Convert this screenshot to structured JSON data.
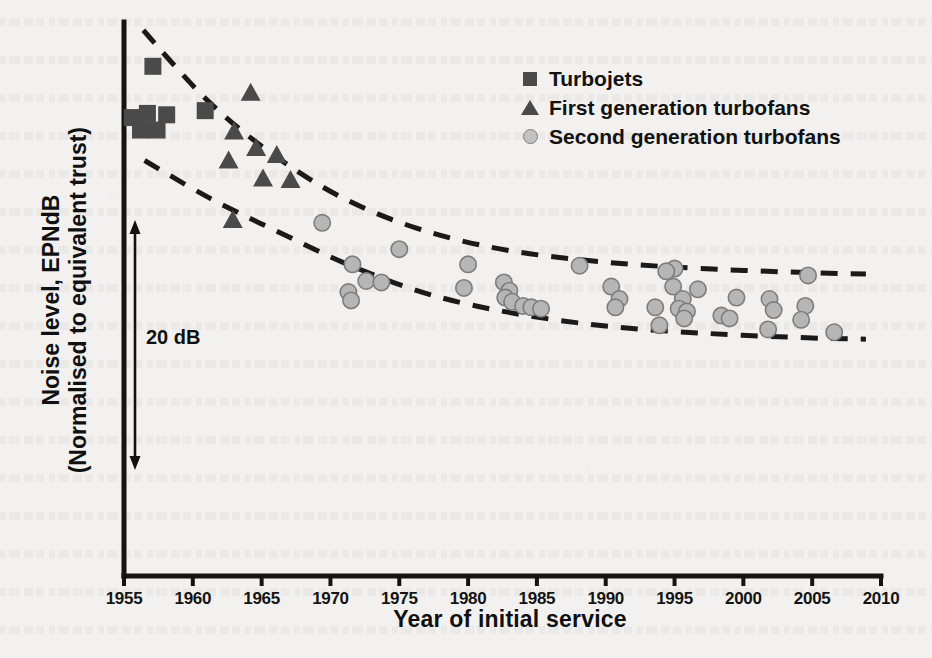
{
  "chart_data": {
    "type": "scatter",
    "title": "",
    "xlabel": "Year of initial service",
    "ylabel": "Noise level, EPNdB\n(Normalised to equivalent trust)",
    "ylabel_line1": "Noise level, EPNdB",
    "ylabel_line2": "(Normalised to equivalent trust)",
    "xlim": [
      1955,
      2010
    ],
    "ylim": [
      0,
      40
    ],
    "xticks": [
      1955,
      1960,
      1965,
      1970,
      1975,
      1980,
      1985,
      1990,
      1995,
      2000,
      2005,
      2010
    ],
    "yticks": [],
    "grid": false,
    "annotations": [
      {
        "name": "range-arrow",
        "text": "20 dB",
        "value": 20,
        "unit": "dB",
        "orientation": "vertical-double-arrow"
      }
    ],
    "legend": {
      "position": "top-right",
      "entries": [
        {
          "label": "Turbojets",
          "marker": "square",
          "color": "#4a4a4a"
        },
        {
          "label": "First generation turbofans",
          "marker": "triangle",
          "color": "#4a4a4a"
        },
        {
          "label": "Second generation turbofans",
          "marker": "circle",
          "color": "#b6b6b6"
        }
      ]
    },
    "series": [
      {
        "name": "Turbojets",
        "marker": "square",
        "color": "#4a4a4a",
        "points": [
          [
            1957.1,
            36.8
          ],
          [
            1955.6,
            33.1
          ],
          [
            1956.7,
            33.4
          ],
          [
            1958.1,
            33.3
          ],
          [
            1956.2,
            32.2
          ],
          [
            1957.4,
            32.2
          ],
          [
            1960.9,
            33.6
          ]
        ]
      },
      {
        "name": "First generation turbofans",
        "marker": "triangle",
        "color": "#4a4a4a",
        "points": [
          [
            1964.2,
            34.9
          ],
          [
            1963.0,
            32.1
          ],
          [
            1964.6,
            30.9
          ],
          [
            1966.1,
            30.4
          ],
          [
            1962.6,
            30.0
          ],
          [
            1965.1,
            28.7
          ],
          [
            1967.1,
            28.6
          ],
          [
            1962.9,
            25.7
          ]
        ]
      },
      {
        "name": "Second generation turbofans",
        "marker": "circle",
        "color": "#b6b6b6",
        "points": [
          [
            1969.4,
            25.5
          ],
          [
            1975.0,
            23.6
          ],
          [
            1971.6,
            22.5
          ],
          [
            1980.0,
            22.5
          ],
          [
            1988.1,
            22.4
          ],
          [
            1995.0,
            22.2
          ],
          [
            1994.4,
            22.0
          ],
          [
            2004.7,
            21.7
          ],
          [
            1972.6,
            21.3
          ],
          [
            1973.7,
            21.2
          ],
          [
            1979.7,
            20.8
          ],
          [
            1982.6,
            21.2
          ],
          [
            1983.0,
            20.6
          ],
          [
            1990.4,
            20.9
          ],
          [
            1994.9,
            20.9
          ],
          [
            1996.7,
            20.7
          ],
          [
            1971.3,
            20.5
          ],
          [
            1971.5,
            19.9
          ],
          [
            1982.7,
            20.1
          ],
          [
            1983.2,
            19.8
          ],
          [
            1991.0,
            20.0
          ],
          [
            1995.6,
            20.0
          ],
          [
            1999.5,
            20.1
          ],
          [
            2001.9,
            20.0
          ],
          [
            1984.0,
            19.5
          ],
          [
            1984.6,
            19.4
          ],
          [
            1985.3,
            19.3
          ],
          [
            1990.7,
            19.4
          ],
          [
            1993.6,
            19.4
          ],
          [
            1995.3,
            19.3
          ],
          [
            1995.9,
            19.1
          ],
          [
            2002.2,
            19.2
          ],
          [
            2004.5,
            19.5
          ],
          [
            1995.7,
            18.6
          ],
          [
            1998.4,
            18.8
          ],
          [
            1999.0,
            18.6
          ],
          [
            2004.2,
            18.5
          ],
          [
            1993.9,
            18.1
          ],
          [
            2001.8,
            17.8
          ],
          [
            2006.6,
            17.6
          ]
        ]
      }
    ],
    "boundaries": [
      {
        "name": "upper-bound",
        "style": "dashed",
        "points": [
          [
            1956.4,
            39.4
          ],
          [
            1961.0,
            34.4
          ],
          [
            1965.6,
            30.6
          ],
          [
            1970.7,
            27.4
          ],
          [
            1976.3,
            25.1
          ],
          [
            1982.4,
            23.6
          ],
          [
            1989.5,
            22.7
          ],
          [
            1996.9,
            22.2
          ],
          [
            2004.9,
            21.9
          ],
          [
            2008.9,
            21.8
          ]
        ]
      },
      {
        "name": "lower-bound",
        "style": "dashed",
        "points": [
          [
            1956.5,
            30.0
          ],
          [
            1961.2,
            27.3
          ],
          [
            1966.3,
            24.8
          ],
          [
            1971.5,
            22.4
          ],
          [
            1977.3,
            20.3
          ],
          [
            1983.7,
            18.9
          ],
          [
            1990.5,
            18.0
          ],
          [
            1997.6,
            17.5
          ],
          [
            2004.6,
            17.2
          ],
          [
            2008.9,
            17.1
          ]
        ]
      }
    ]
  },
  "axis": {
    "x_ticks": [
      "1955",
      "1960",
      "1965",
      "1970",
      "1975",
      "1980",
      "1985",
      "1990",
      "1995",
      "2000",
      "2005",
      "2010"
    ],
    "x_title": "Year of initial service",
    "y_title_line1": "Noise level, EPNdB",
    "y_title_line2": "(Normalised to equivalent trust)"
  },
  "annotation": {
    "db_label": "20 dB"
  },
  "legend": {
    "items": [
      {
        "label": "Turbojets",
        "icon": "square-marker-icon"
      },
      {
        "label": "First generation turbofans",
        "icon": "triangle-marker-icon"
      },
      {
        "label": "Second generation turbofans",
        "icon": "circle-marker-icon"
      }
    ]
  },
  "colors": {
    "marker_dark": "#4a4a4a",
    "marker_light": "#b6b6b6",
    "axis": "#141414",
    "background": "#f2f1ef"
  }
}
